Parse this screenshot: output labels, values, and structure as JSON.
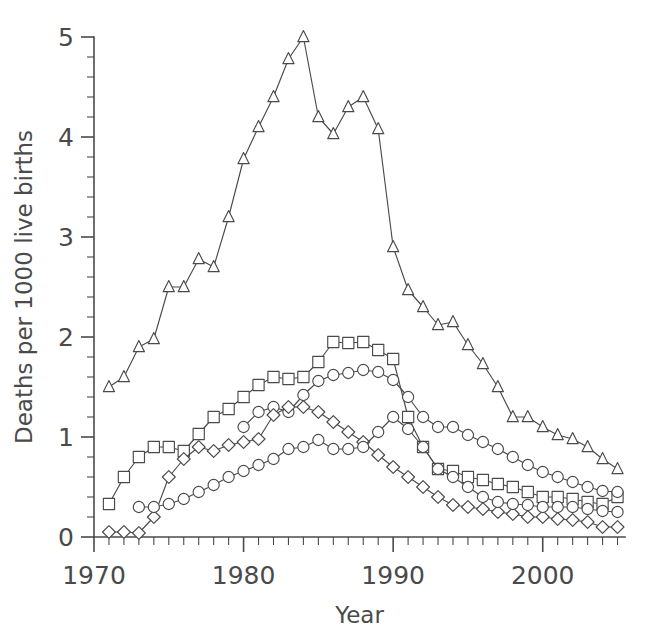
{
  "chart_data": {
    "type": "line",
    "title": "",
    "subtitle": "",
    "xlabel": "Year",
    "ylabel": "Deaths per 1000 live births",
    "xlim": [
      1970,
      2005.5
    ],
    "ylim": [
      0,
      5
    ],
    "x_ticks_major": [
      1970,
      1980,
      1990,
      2000
    ],
    "x_tick_labels": [
      "1970",
      "1980",
      "1990",
      "2000"
    ],
    "x_minor_step": 1,
    "y_ticks_major": [
      0,
      1,
      2,
      3,
      4,
      5
    ],
    "y_tick_labels": [
      "0",
      "1",
      "2",
      "3",
      "4",
      "5"
    ],
    "y_minor_step": 0.2,
    "grid": false,
    "legend": null,
    "legend_position": "none",
    "annotations": [],
    "series": [
      {
        "name": "triangle-series",
        "marker": "triangle",
        "x": [
          1971,
          1972,
          1973,
          1974,
          1975,
          1976,
          1977,
          1978,
          1979,
          1980,
          1981,
          1982,
          1983,
          1984,
          1985,
          1986,
          1987,
          1988,
          1989,
          1990,
          1991,
          1992,
          1993,
          1994,
          1995,
          1996,
          1997,
          1998,
          1999,
          2000,
          2001,
          2002,
          2003,
          2004,
          2005
        ],
        "values": [
          1.5,
          1.6,
          1.9,
          1.98,
          2.5,
          2.5,
          2.78,
          2.7,
          3.2,
          3.78,
          4.1,
          4.4,
          4.78,
          5.0,
          4.2,
          4.03,
          4.3,
          4.4,
          4.08,
          2.9,
          2.47,
          2.3,
          2.12,
          2.15,
          1.92,
          1.73,
          1.5,
          1.2,
          1.2,
          1.1,
          1.02,
          0.98,
          0.9,
          0.78,
          0.68
        ]
      },
      {
        "name": "square-series",
        "marker": "square",
        "x": [
          1971,
          1972,
          1973,
          1974,
          1975,
          1976,
          1977,
          1978,
          1979,
          1980,
          1981,
          1982,
          1983,
          1984,
          1985,
          1986,
          1987,
          1988,
          1989,
          1990,
          1991,
          1992,
          1993,
          1994,
          1995,
          1996,
          1997,
          1998,
          1999,
          2000,
          2001,
          2002,
          2003,
          2004,
          2005
        ],
        "values": [
          0.33,
          0.6,
          0.8,
          0.9,
          0.9,
          0.86,
          1.03,
          1.2,
          1.28,
          1.4,
          1.52,
          1.6,
          1.58,
          1.6,
          1.75,
          1.95,
          1.94,
          1.95,
          1.87,
          1.78,
          1.2,
          0.9,
          0.68,
          0.66,
          0.6,
          0.57,
          0.53,
          0.5,
          0.45,
          0.4,
          0.4,
          0.38,
          0.35,
          0.33,
          0.4
        ]
      },
      {
        "name": "circle-series-upper",
        "marker": "circle",
        "x": [
          1980,
          1981,
          1982,
          1983,
          1984,
          1985,
          1986,
          1987,
          1988,
          1989,
          1990,
          1991,
          1992,
          1993,
          1994,
          1995,
          1996,
          1997,
          1998,
          1999,
          2000,
          2001,
          2002,
          2003,
          2004,
          2005
        ],
        "values": [
          1.1,
          1.25,
          1.3,
          1.25,
          1.42,
          1.56,
          1.62,
          1.64,
          1.67,
          1.65,
          1.57,
          1.4,
          1.2,
          1.1,
          1.1,
          1.02,
          0.95,
          0.88,
          0.8,
          0.72,
          0.65,
          0.6,
          0.55,
          0.5,
          0.46,
          0.45
        ]
      },
      {
        "name": "diamond-series",
        "marker": "diamond",
        "x": [
          1971,
          1972,
          1973,
          1974,
          1975,
          1976,
          1977,
          1978,
          1979,
          1980,
          1981,
          1982,
          1983,
          1984,
          1985,
          1986,
          1987,
          1988,
          1989,
          1990,
          1991,
          1992,
          1993,
          1994,
          1995,
          1996,
          1997,
          1998,
          1999,
          2000,
          2001,
          2002,
          2003,
          2004,
          2005
        ],
        "values": [
          0.05,
          0.05,
          0.04,
          0.2,
          0.6,
          0.78,
          0.9,
          0.86,
          0.92,
          0.95,
          0.98,
          1.22,
          1.3,
          1.3,
          1.25,
          1.15,
          1.05,
          0.95,
          0.82,
          0.7,
          0.6,
          0.5,
          0.4,
          0.32,
          0.3,
          0.28,
          0.25,
          0.23,
          0.2,
          0.2,
          0.18,
          0.17,
          0.15,
          0.1,
          0.1
        ]
      },
      {
        "name": "circle-series-lower",
        "marker": "circle",
        "x": [
          1973,
          1974,
          1975,
          1976,
          1977,
          1978,
          1979,
          1980,
          1981,
          1982,
          1983,
          1984,
          1985,
          1986,
          1987,
          1988,
          1989,
          1990,
          1991,
          1992,
          1993,
          1994,
          1995,
          1996,
          1997,
          1998,
          1999,
          2000,
          2001,
          2002,
          2003,
          2004,
          2005
        ],
        "values": [
          0.3,
          0.3,
          0.33,
          0.38,
          0.45,
          0.52,
          0.6,
          0.66,
          0.72,
          0.78,
          0.88,
          0.9,
          0.97,
          0.88,
          0.88,
          0.9,
          1.05,
          1.2,
          1.08,
          0.9,
          0.68,
          0.6,
          0.5,
          0.4,
          0.35,
          0.33,
          0.32,
          0.3,
          0.3,
          0.3,
          0.28,
          0.26,
          0.25
        ]
      }
    ]
  },
  "colors": {
    "ink": "#4a4a4a",
    "background": "#ffffff",
    "marker_fill": "#ffffff"
  }
}
